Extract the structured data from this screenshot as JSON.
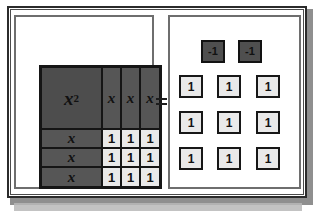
{
  "figure": {
    "name": "algebra-tiles-equation",
    "relation_symbol": "=",
    "left_panel": {
      "label": "algebra tile area model",
      "quadratic_tile": {
        "base": "x",
        "exponent": "2"
      },
      "top_x_tiles": [
        "x",
        "x",
        "x"
      ],
      "left_x_tiles": [
        "x",
        "x",
        "x"
      ],
      "unit_tile_grid": [
        [
          "1",
          "1",
          "1"
        ],
        [
          "1",
          "1",
          "1"
        ],
        [
          "1",
          "1",
          "1"
        ]
      ]
    },
    "right_panel": {
      "label": "counter set",
      "negative_counters": [
        "-1",
        "-1"
      ],
      "positive_rows": [
        [
          "1",
          "1",
          "1"
        ],
        [
          "1",
          "1",
          "1"
        ],
        [
          "1",
          "1",
          "1"
        ]
      ]
    }
  },
  "colors": {
    "x_squared_tile": "#4d4d4d",
    "x_tile": "#565656",
    "unit_tile": "#e9e9e9",
    "negative_counter": "#4f4f4f",
    "tile_border": "#151515",
    "frame": "#2b2b2b",
    "panel_border": "#6e6e6e",
    "page_background": "#ffffff"
  }
}
